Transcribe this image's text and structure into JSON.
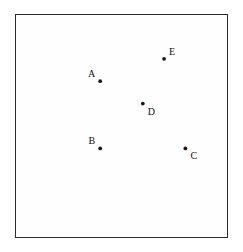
{
  "figure": {
    "title": "",
    "background_color": "#ffffff"
  },
  "grid": {
    "columns": 10,
    "rows": 10,
    "line_color": "#3c3c3c",
    "border_color": "#2b2b2b",
    "cell_fill": "#fefefe",
    "x_min": 0,
    "x_max": 10,
    "y_min": 0,
    "y_max": 10
  },
  "chart_data": {
    "type": "scatter",
    "title": "",
    "xlabel": "",
    "ylabel": "",
    "xlim": [
      0,
      10
    ],
    "ylim": [
      0,
      10
    ],
    "grid": true,
    "legend": "none",
    "categories": [
      "A",
      "B",
      "C",
      "D",
      "E"
    ],
    "points": [
      {
        "label": "A",
        "col": 4,
        "row_from_top": 3,
        "x": 4,
        "y": 7,
        "label_position": "upper-left",
        "dot_color": "#1a1a1a"
      },
      {
        "label": "B",
        "col": 4,
        "row_from_top": 6,
        "x": 4,
        "y": 4,
        "label_position": "upper-left",
        "dot_color": "#1a1a1a"
      },
      {
        "label": "C",
        "col": 8,
        "row_from_top": 6,
        "x": 8,
        "y": 4,
        "label_position": "lower-right",
        "dot_color": "#1a1a1a"
      },
      {
        "label": "D",
        "col": 6,
        "row_from_top": 4,
        "x": 6,
        "y": 6,
        "label_position": "lower-right",
        "dot_color": "#1a1a1a"
      },
      {
        "label": "E",
        "col": 7,
        "row_from_top": 2,
        "x": 7,
        "y": 8,
        "label_position": "upper-right",
        "dot_color": "#1a1a1a"
      }
    ]
  }
}
